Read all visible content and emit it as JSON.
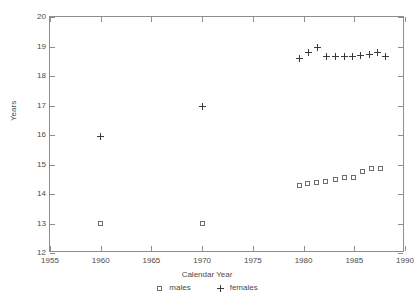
{
  "chart_data": {
    "type": "scatter",
    "title": "",
    "xlabel": "Calendar Year",
    "ylabel": "Years",
    "xlim": [
      1955,
      1990
    ],
    "ylim": [
      12,
      20
    ],
    "xticks": [
      1955,
      1960,
      1965,
      1970,
      1975,
      1980,
      1985,
      1990
    ],
    "yticks": [
      12,
      13,
      14,
      15,
      16,
      17,
      18,
      19,
      20
    ],
    "grid": false,
    "legend_position": "below-axis-center",
    "series": [
      {
        "name": "males",
        "marker": "square",
        "points": [
          {
            "x": 1960,
            "y": 13.0
          },
          {
            "x": 1970,
            "y": 13.0
          },
          {
            "x": 1979.6,
            "y": 14.3
          },
          {
            "x": 1980.4,
            "y": 14.35
          },
          {
            "x": 1981.3,
            "y": 14.4
          },
          {
            "x": 1982.2,
            "y": 14.42
          },
          {
            "x": 1983.1,
            "y": 14.5
          },
          {
            "x": 1984.0,
            "y": 14.55
          },
          {
            "x": 1984.9,
            "y": 14.55
          },
          {
            "x": 1985.8,
            "y": 14.75
          },
          {
            "x": 1986.7,
            "y": 14.85
          },
          {
            "x": 1987.6,
            "y": 14.87
          }
        ]
      },
      {
        "name": "females",
        "marker": "plus",
        "points": [
          {
            "x": 1960,
            "y": 15.95
          },
          {
            "x": 1970,
            "y": 16.95
          },
          {
            "x": 1979.6,
            "y": 18.6
          },
          {
            "x": 1980.5,
            "y": 18.78
          },
          {
            "x": 1981.4,
            "y": 18.95
          },
          {
            "x": 1982.3,
            "y": 18.67
          },
          {
            "x": 1983.1,
            "y": 18.67
          },
          {
            "x": 1984.0,
            "y": 18.67
          },
          {
            "x": 1984.8,
            "y": 18.67
          },
          {
            "x": 1985.6,
            "y": 18.68
          },
          {
            "x": 1986.5,
            "y": 18.72
          },
          {
            "x": 1987.3,
            "y": 18.8
          },
          {
            "x": 1988.1,
            "y": 18.67
          }
        ]
      }
    ],
    "legend": [
      {
        "label": "males",
        "marker": "square"
      },
      {
        "label": "females",
        "marker": "plus"
      }
    ],
    "colors": {
      "axis": "#8e8e8e",
      "text": "#4a4a4a",
      "males_marker": "#6d6d6d",
      "females_marker": "#3a3a3a",
      "background": "#ffffff"
    }
  },
  "caption_fragment": ""
}
